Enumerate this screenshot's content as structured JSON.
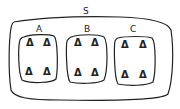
{
  "diagram": {
    "universal_set": {
      "label": "S"
    },
    "subsets": [
      {
        "label": "A",
        "elements": [
          "Δ",
          "Δ",
          "Δ",
          "Δ"
        ]
      },
      {
        "label": "B",
        "elements": [
          "Δ",
          "Δ",
          "Δ",
          "Δ"
        ]
      },
      {
        "label": "C",
        "elements": [
          "Δ",
          "Δ",
          "Δ",
          "Δ"
        ]
      }
    ]
  }
}
